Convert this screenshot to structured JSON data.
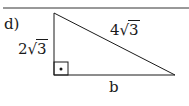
{
  "problem_label": "d)",
  "triangle": {
    "type": "right-triangle",
    "vertical_leg": {
      "coef": "2",
      "radicand": "3"
    },
    "hypotenuse": {
      "coef": "4",
      "radicand": "3"
    },
    "base_label": "b",
    "right_angle_marker": "dot-in-square"
  },
  "colors": {
    "stroke": "#1a1a1a",
    "background": "#ffffff"
  }
}
